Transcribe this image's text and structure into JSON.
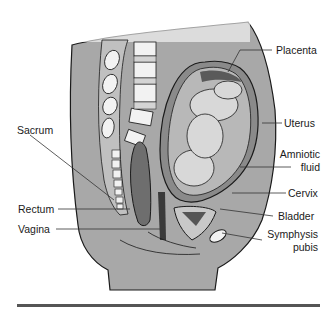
{
  "diagram": {
    "colors": {
      "tissue": "#a8a8a8",
      "tissue_dark": "#8a8a8a",
      "bone": "#f2f2f2",
      "outline": "#1a1a1a",
      "fetus": "#d8d8d8",
      "rule": "#555555"
    },
    "labels": {
      "placenta": "Placenta",
      "uterus": "Uterus",
      "amniotic_1": "Amniotic",
      "amniotic_2": "fluid",
      "cervix": "Cervix",
      "bladder": "Bladder",
      "symphysis_1": "Symphysis",
      "symphysis_2": "pubis",
      "sacrum": "Sacrum",
      "rectum": "Rectum",
      "vagina": "Vagina"
    }
  }
}
